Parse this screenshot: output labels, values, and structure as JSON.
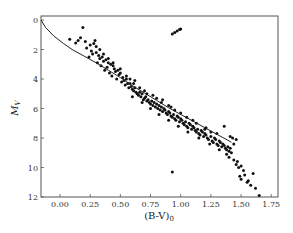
{
  "chart_data": {
    "type": "scatter",
    "title": "",
    "xlabel": "(B-V)0",
    "ylabel": "MV",
    "xlim": [
      -0.16,
      1.8
    ],
    "ylim": [
      12,
      -0.2
    ],
    "y_inverted": true,
    "grid": false,
    "legend": null,
    "xticks": [
      0.0,
      0.25,
      0.5,
      0.75,
      1.0,
      1.25,
      1.5,
      1.75
    ],
    "xtick_labels": [
      "0.00",
      "0.25",
      "0.50",
      "0.75",
      "1.00",
      "1.25",
      "1.50",
      "1.75"
    ],
    "yticks": [
      0,
      2,
      4,
      6,
      8,
      10,
      12
    ],
    "ytick_labels": [
      "0",
      "2",
      "4",
      "6",
      "8",
      "10",
      "12"
    ],
    "series": [
      {
        "name": "stars",
        "kind": "scatter",
        "points": [
          [
            0.19,
            0.5
          ],
          [
            0.08,
            1.3
          ],
          [
            0.15,
            1.4
          ],
          [
            0.17,
            1.2
          ],
          [
            0.13,
            1.55
          ],
          [
            0.21,
            1.45
          ],
          [
            0.25,
            1.7
          ],
          [
            0.28,
            1.6
          ],
          [
            0.29,
            1.4
          ],
          [
            0.3,
            1.8
          ],
          [
            0.22,
            1.9
          ],
          [
            0.26,
            2.1
          ],
          [
            0.27,
            2.3
          ],
          [
            0.3,
            2.2
          ],
          [
            0.32,
            2.4
          ],
          [
            0.24,
            2.5
          ],
          [
            0.33,
            2.6
          ],
          [
            0.35,
            2.5
          ],
          [
            0.36,
            2.8
          ],
          [
            0.38,
            2.7
          ],
          [
            0.31,
            2.9
          ],
          [
            0.4,
            2.9
          ],
          [
            0.42,
            3.0
          ],
          [
            0.34,
            3.1
          ],
          [
            0.39,
            3.2
          ],
          [
            0.44,
            3.1
          ],
          [
            0.45,
            3.3
          ],
          [
            0.37,
            3.4
          ],
          [
            0.46,
            3.5
          ],
          [
            0.48,
            3.4
          ],
          [
            0.41,
            3.6
          ],
          [
            0.49,
            3.7
          ],
          [
            0.5,
            3.6
          ],
          [
            0.43,
            3.8
          ],
          [
            0.52,
            3.9
          ],
          [
            0.47,
            4.0
          ],
          [
            0.53,
            4.1
          ],
          [
            0.55,
            4.0
          ],
          [
            0.51,
            4.2
          ],
          [
            0.56,
            4.3
          ],
          [
            0.54,
            4.4
          ],
          [
            0.58,
            4.3
          ],
          [
            0.59,
            4.5
          ],
          [
            0.57,
            4.6
          ],
          [
            0.6,
            4.7
          ],
          [
            0.62,
            4.6
          ],
          [
            0.61,
            4.8
          ],
          [
            0.63,
            4.9
          ],
          [
            0.64,
            5.0
          ],
          [
            0.66,
            4.9
          ],
          [
            0.65,
            5.1
          ],
          [
            0.67,
            5.2
          ],
          [
            0.68,
            5.0
          ],
          [
            0.7,
            5.3
          ],
          [
            0.69,
            5.4
          ],
          [
            0.71,
            5.2
          ],
          [
            0.72,
            5.5
          ],
          [
            0.73,
            5.4
          ],
          [
            0.74,
            5.6
          ],
          [
            0.76,
            5.5
          ],
          [
            0.75,
            5.7
          ],
          [
            0.77,
            5.8
          ],
          [
            0.78,
            5.6
          ],
          [
            0.79,
            5.9
          ],
          [
            0.8,
            5.7
          ],
          [
            0.82,
            5.8
          ],
          [
            0.81,
            6.0
          ],
          [
            0.83,
            6.1
          ],
          [
            0.84,
            5.9
          ],
          [
            0.85,
            6.2
          ],
          [
            0.86,
            6.0
          ],
          [
            0.88,
            6.3
          ],
          [
            0.87,
            6.1
          ],
          [
            0.89,
            6.4
          ],
          [
            0.9,
            6.2
          ],
          [
            0.92,
            6.5
          ],
          [
            0.91,
            6.3
          ],
          [
            0.93,
            6.6
          ],
          [
            0.94,
            6.4
          ],
          [
            0.95,
            6.7
          ],
          [
            0.97,
            6.5
          ],
          [
            0.96,
            6.8
          ],
          [
            0.98,
            6.6
          ],
          [
            0.99,
            6.9
          ],
          [
            1.0,
            6.7
          ],
          [
            1.02,
            7.0
          ],
          [
            1.01,
            6.8
          ],
          [
            1.03,
            7.1
          ],
          [
            1.04,
            6.9
          ],
          [
            1.05,
            7.2
          ],
          [
            1.07,
            7.0
          ],
          [
            1.06,
            7.3
          ],
          [
            1.08,
            7.1
          ],
          [
            1.09,
            7.4
          ],
          [
            1.1,
            7.2
          ],
          [
            1.12,
            7.5
          ],
          [
            1.11,
            7.3
          ],
          [
            1.13,
            7.6
          ],
          [
            1.14,
            7.4
          ],
          [
            1.15,
            7.7
          ],
          [
            1.17,
            7.5
          ],
          [
            1.16,
            7.8
          ],
          [
            1.18,
            7.6
          ],
          [
            1.19,
            7.9
          ],
          [
            1.2,
            7.7
          ],
          [
            1.22,
            8.0
          ],
          [
            1.21,
            7.8
          ],
          [
            1.23,
            8.1
          ],
          [
            1.25,
            7.9
          ],
          [
            1.26,
            8.2
          ],
          [
            1.28,
            8.0
          ],
          [
            1.27,
            8.3
          ],
          [
            1.29,
            8.1
          ],
          [
            1.3,
            8.4
          ],
          [
            1.32,
            8.2
          ],
          [
            1.31,
            8.5
          ],
          [
            1.33,
            8.3
          ],
          [
            1.34,
            8.6
          ],
          [
            1.35,
            8.4
          ],
          [
            1.37,
            8.7
          ],
          [
            1.36,
            8.5
          ],
          [
            1.38,
            8.8
          ],
          [
            1.39,
            8.6
          ],
          [
            1.4,
            8.9
          ],
          [
            1.41,
            8.7
          ],
          [
            1.38,
            9.1
          ],
          [
            1.4,
            9.3
          ],
          [
            1.42,
            9.0
          ],
          [
            1.44,
            9.5
          ],
          [
            1.46,
            9.8
          ],
          [
            1.47,
            9.6
          ],
          [
            1.48,
            10.0
          ],
          [
            1.5,
            9.9
          ],
          [
            1.52,
            10.2
          ],
          [
            1.49,
            10.6
          ],
          [
            1.5,
            10.8
          ],
          [
            1.53,
            10.5
          ],
          [
            1.56,
            10.9
          ],
          [
            1.58,
            11.2
          ],
          [
            1.6,
            10.4
          ],
          [
            1.55,
            11.0
          ],
          [
            1.62,
            11.4
          ],
          [
            1.65,
            11.9
          ],
          [
            1.36,
            7.2
          ],
          [
            1.41,
            7.9
          ],
          [
            1.43,
            8.0
          ],
          [
            1.44,
            8.4
          ],
          [
            1.46,
            8.1
          ],
          [
            1.3,
            7.7
          ],
          [
            1.21,
            7.3
          ],
          [
            1.1,
            6.8
          ],
          [
            1.0,
            6.3
          ],
          [
            0.92,
            5.9
          ],
          [
            0.84,
            5.6
          ],
          [
            0.8,
            5.3
          ],
          [
            0.72,
            5.0
          ],
          [
            0.66,
            4.6
          ],
          [
            0.61,
            4.3
          ],
          [
            0.55,
            3.8
          ],
          [
            0.5,
            3.3
          ],
          [
            0.44,
            2.9
          ],
          [
            0.4,
            2.6
          ],
          [
            0.36,
            2.3
          ],
          [
            0.33,
            2.0
          ],
          [
            0.58,
            4.0
          ],
          [
            0.62,
            4.1
          ],
          [
            0.7,
            4.8
          ],
          [
            0.77,
            5.1
          ],
          [
            0.85,
            5.4
          ],
          [
            0.9,
            5.8
          ],
          [
            0.95,
            6.1
          ],
          [
            1.05,
            6.6
          ],
          [
            1.13,
            7.0
          ],
          [
            1.2,
            7.4
          ],
          [
            1.25,
            7.6
          ],
          [
            0.6,
            5.2
          ],
          [
            0.68,
            5.6
          ],
          [
            0.75,
            6.0
          ],
          [
            0.82,
            6.4
          ],
          [
            0.9,
            6.8
          ],
          [
            0.98,
            7.2
          ],
          [
            1.06,
            7.6
          ],
          [
            1.15,
            8.0
          ],
          [
            1.24,
            8.4
          ],
          [
            1.32,
            8.8
          ],
          [
            0.93,
            10.3
          ]
        ]
      },
      {
        "name": "giant-clump",
        "kind": "scatter",
        "points": [
          [
            0.93,
            0.95
          ],
          [
            0.95,
            0.85
          ],
          [
            0.97,
            0.75
          ],
          [
            0.99,
            0.65
          ],
          [
            1.0,
            0.6
          ]
        ]
      },
      {
        "name": "ZAMS",
        "kind": "line",
        "points": [
          [
            -0.16,
            0.0
          ],
          [
            -0.12,
            0.5
          ],
          [
            -0.05,
            1.1
          ],
          [
            0.03,
            1.6
          ],
          [
            0.1,
            2.0
          ],
          [
            0.2,
            2.45
          ],
          [
            0.3,
            2.9
          ],
          [
            0.4,
            3.4
          ],
          [
            0.5,
            3.9
          ],
          [
            0.6,
            4.45
          ],
          [
            0.7,
            4.95
          ],
          [
            0.8,
            5.45
          ],
          [
            0.9,
            5.95
          ],
          [
            1.0,
            6.4
          ],
          [
            1.1,
            6.85
          ],
          [
            1.2,
            7.3
          ],
          [
            1.3,
            7.75
          ],
          [
            1.4,
            8.2
          ],
          [
            1.42,
            8.3
          ]
        ]
      }
    ]
  }
}
